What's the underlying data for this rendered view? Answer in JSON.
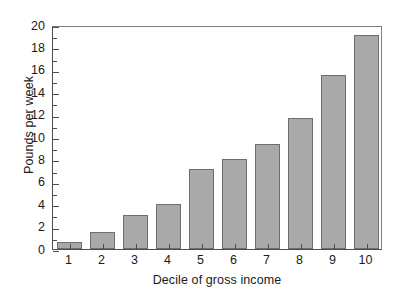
{
  "chart_data": {
    "type": "bar",
    "title": "",
    "subtitle": "",
    "xlabel": "Decile of gross income",
    "ylabel": "Pounds per week",
    "categories": [
      "1",
      "2",
      "3",
      "4",
      "5",
      "6",
      "7",
      "8",
      "9",
      "10"
    ],
    "values": [
      0.65,
      1.55,
      3.0,
      4.0,
      7.1,
      8.0,
      9.4,
      11.7,
      15.5,
      19.1
    ],
    "series": [
      {
        "name": "Expenditure",
        "values": [
          0.65,
          1.55,
          3.0,
          4.0,
          7.1,
          8.0,
          9.4,
          11.7,
          15.5,
          19.1
        ]
      }
    ],
    "ylim": [
      0,
      20
    ],
    "y_major_ticks": [
      0,
      2,
      4,
      6,
      8,
      10,
      12,
      14,
      16,
      18,
      20
    ],
    "y_minor_ticks": [
      1,
      3,
      5,
      7,
      9,
      11,
      13,
      15,
      17,
      19
    ],
    "y_tick_labels": [
      "0",
      "2",
      "4",
      "6",
      "8",
      "10",
      "12",
      "14",
      "16",
      "18",
      "20"
    ],
    "x_tick_labels": [
      "1",
      "2",
      "3",
      "4",
      "5",
      "6",
      "7",
      "8",
      "9",
      "10"
    ],
    "grid": false,
    "legend": null,
    "legend_position": "none",
    "bar_fill_color": "#a9a9a9",
    "bar_edge_color": "#6e6e6e",
    "axis_color": "#4d4d4d",
    "background_color": "#ffffff"
  }
}
